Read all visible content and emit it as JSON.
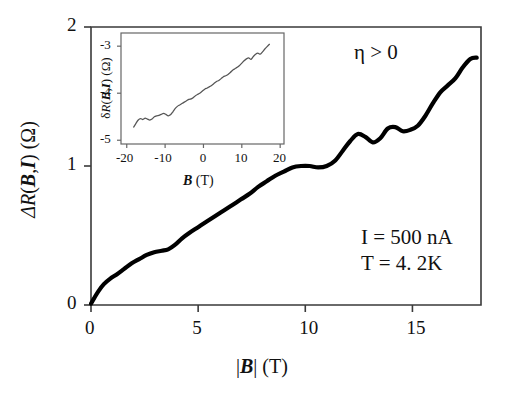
{
  "chart_data": {
    "type": "line",
    "title": "",
    "xlabel": "|B| (T)",
    "ylabel": "ΔR(B,I) (Ω)",
    "xlim": [
      0,
      18.2
    ],
    "ylim": [
      0,
      2
    ],
    "grid": false,
    "legend": null,
    "xticks": [
      0,
      5,
      10,
      15
    ],
    "yticks": [
      0,
      1,
      2
    ],
    "xtick_labels": [
      "0",
      "5",
      "10",
      "15"
    ],
    "ytick_labels": [
      "0",
      "1",
      "2"
    ],
    "annotations": [
      {
        "id": "eta",
        "text": "η > 0",
        "x": 13.2,
        "y": 1.88
      },
      {
        "id": "current",
        "text": "I = 500 nA",
        "x": 13.6,
        "y": 0.58
      },
      {
        "id": "temperature",
        "text": "T = 4. 2K",
        "x": 13.6,
        "y": 0.4
      }
    ],
    "series": [
      {
        "name": "ΔR(|B|,I)",
        "color": "#000000",
        "x": [
          0.0,
          0.15,
          0.35,
          0.6,
          0.9,
          1.2,
          1.55,
          1.9,
          2.25,
          2.6,
          2.95,
          3.3,
          3.6,
          3.9,
          4.25,
          4.6,
          5.0,
          5.4,
          5.8,
          6.2,
          6.6,
          7.0,
          7.4,
          7.8,
          8.2,
          8.6,
          9.0,
          9.4,
          9.8,
          10.2,
          10.6,
          11.0,
          11.4,
          11.75,
          12.1,
          12.45,
          12.8,
          13.15,
          13.5,
          13.85,
          14.2,
          14.55,
          14.9,
          15.25,
          15.6,
          15.95,
          16.3,
          16.65,
          17.0,
          17.35,
          17.7,
          18.0
        ],
        "y": [
          0.01,
          0.05,
          0.1,
          0.15,
          0.19,
          0.22,
          0.26,
          0.3,
          0.33,
          0.36,
          0.38,
          0.39,
          0.4,
          0.43,
          0.48,
          0.52,
          0.56,
          0.6,
          0.64,
          0.68,
          0.72,
          0.76,
          0.8,
          0.85,
          0.89,
          0.93,
          0.96,
          0.99,
          1.0,
          1.0,
          0.99,
          1.0,
          1.04,
          1.11,
          1.18,
          1.23,
          1.21,
          1.17,
          1.2,
          1.27,
          1.28,
          1.25,
          1.26,
          1.29,
          1.36,
          1.45,
          1.53,
          1.58,
          1.63,
          1.71,
          1.77,
          1.78
        ]
      }
    ],
    "inset": {
      "type": "line",
      "xlabel": "B (T)",
      "ylabel": "δR(B,I) (Ω)",
      "xlim": [
        -21.5,
        21.0
      ],
      "ylim": [
        -5.08,
        -2.72
      ],
      "grid": false,
      "xticks": [
        -20,
        -10,
        0,
        10,
        20
      ],
      "yticks": [
        -3,
        -4,
        -5
      ],
      "xtick_labels": [
        "-20",
        "-10",
        "0",
        "10",
        "20"
      ],
      "ytick_labels": [
        "-3",
        "-4",
        "-5"
      ],
      "series": [
        {
          "name": "δR(B,I)",
          "color": "#555555",
          "x": [
            -18.2,
            -17.6,
            -17.0,
            -16.4,
            -15.8,
            -15.2,
            -14.6,
            -14.0,
            -13.4,
            -12.8,
            -12.2,
            -11.6,
            -11.0,
            -10.4,
            -9.8,
            -9.2,
            -8.6,
            -8.0,
            -7.4,
            -6.8,
            -6.2,
            -5.6,
            -5.0,
            -4.4,
            -3.8,
            -3.2,
            -2.6,
            -2.0,
            -1.4,
            -0.8,
            -0.2,
            0.4,
            1.0,
            1.6,
            2.2,
            2.8,
            3.4,
            4.0,
            4.6,
            5.2,
            5.8,
            6.4,
            7.0,
            7.6,
            8.2,
            8.8,
            9.4,
            10.0,
            10.6,
            11.2,
            11.8,
            12.4,
            13.0,
            13.6,
            14.2,
            14.8,
            15.4,
            16.0,
            16.6,
            17.2
          ],
          "y": [
            -4.72,
            -4.64,
            -4.57,
            -4.54,
            -4.56,
            -4.53,
            -4.55,
            -4.57,
            -4.55,
            -4.5,
            -4.48,
            -4.47,
            -4.45,
            -4.43,
            -4.45,
            -4.48,
            -4.46,
            -4.4,
            -4.33,
            -4.28,
            -4.25,
            -4.22,
            -4.19,
            -4.16,
            -4.13,
            -4.12,
            -4.09,
            -4.05,
            -4.02,
            -3.99,
            -3.95,
            -3.91,
            -3.89,
            -3.86,
            -3.83,
            -3.79,
            -3.75,
            -3.73,
            -3.69,
            -3.65,
            -3.63,
            -3.6,
            -3.56,
            -3.51,
            -3.48,
            -3.45,
            -3.41,
            -3.36,
            -3.31,
            -3.27,
            -3.25,
            -3.28,
            -3.22,
            -3.17,
            -3.15,
            -3.17,
            -3.12,
            -3.06,
            -3.01,
            -2.96
          ]
        }
      ]
    }
  }
}
